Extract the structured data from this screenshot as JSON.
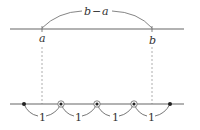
{
  "diagram": {
    "top_line": {
      "point_a_label": "a",
      "point_b_label": "b",
      "arc_label_left": "b",
      "arc_label_dash": "−",
      "arc_label_right": "a",
      "arc_label": "b−a"
    },
    "bottom_line": {
      "unit_labels": [
        "1",
        "1",
        "1",
        "1"
      ],
      "point_count": 5,
      "circled_points": [
        2,
        3,
        4
      ]
    },
    "colors": {
      "line": "#666666",
      "dashed": "#999999",
      "text": "#333333",
      "dot": "#222222"
    }
  }
}
